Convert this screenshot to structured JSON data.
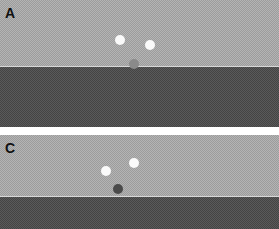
{
  "panels": [
    {
      "label": "A",
      "top": 0,
      "height": 127,
      "boundary_y": 66,
      "dots": [
        {
          "x": 120,
          "y": 40,
          "r": 5,
          "color": "white"
        },
        {
          "x": 150,
          "y": 45,
          "r": 5,
          "color": "white"
        },
        {
          "x": 134,
          "y": 64,
          "r": 5,
          "color": "gray"
        }
      ]
    },
    {
      "label": "C",
      "top": 135,
      "height": 94,
      "boundary_y": 61,
      "dots": [
        {
          "x": 106,
          "y": 36,
          "r": 5,
          "color": "white"
        },
        {
          "x": 134,
          "y": 28,
          "r": 5,
          "color": "white"
        },
        {
          "x": 118,
          "y": 54,
          "r": 5,
          "color": "darkdot"
        }
      ]
    }
  ],
  "colors": {
    "light_region": "#b4b4b4",
    "dark_region": "#5a5a5a",
    "background": "#ffffff"
  }
}
